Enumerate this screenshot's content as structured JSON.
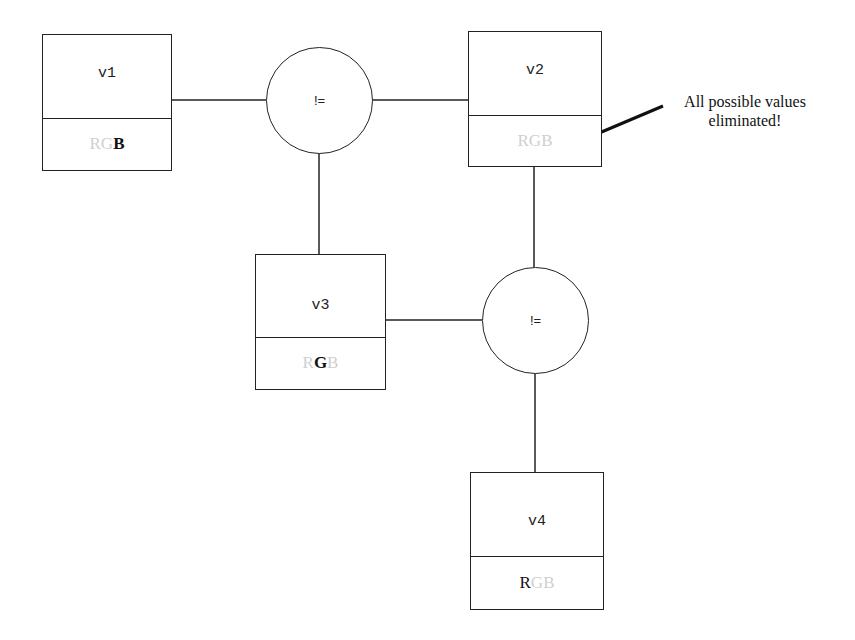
{
  "diagram": {
    "variables": [
      {
        "id": "v1",
        "label": "v1",
        "domain": [
          {
            "letter": "R",
            "active": false
          },
          {
            "letter": "G",
            "active": false
          },
          {
            "letter": "B",
            "active": true
          }
        ]
      },
      {
        "id": "v2",
        "label": "v2",
        "domain": [
          {
            "letter": "R",
            "active": false
          },
          {
            "letter": "G",
            "active": false
          },
          {
            "letter": "B",
            "active": false
          }
        ]
      },
      {
        "id": "v3",
        "label": "v3",
        "domain": [
          {
            "letter": "R",
            "active": false
          },
          {
            "letter": "G",
            "active": true
          },
          {
            "letter": "B",
            "active": false
          }
        ]
      },
      {
        "id": "v4",
        "label": "v4",
        "domain": [
          {
            "letter": "R",
            "active": true
          },
          {
            "letter": "G",
            "active": false
          },
          {
            "letter": "B",
            "active": false
          }
        ]
      }
    ],
    "constraints": [
      {
        "id": "c1",
        "label": "!=",
        "connects": [
          "v1",
          "v2",
          "v3"
        ]
      },
      {
        "id": "c2",
        "label": "!=",
        "connects": [
          "v2",
          "v3",
          "v4"
        ]
      }
    ],
    "annotation": {
      "line1": "All possible values",
      "line2": "eliminated!",
      "points_to": "v2"
    },
    "colors": {
      "line": "#222222",
      "inactive_letter": "#cfcfcf",
      "active_letter": "#111111"
    }
  }
}
